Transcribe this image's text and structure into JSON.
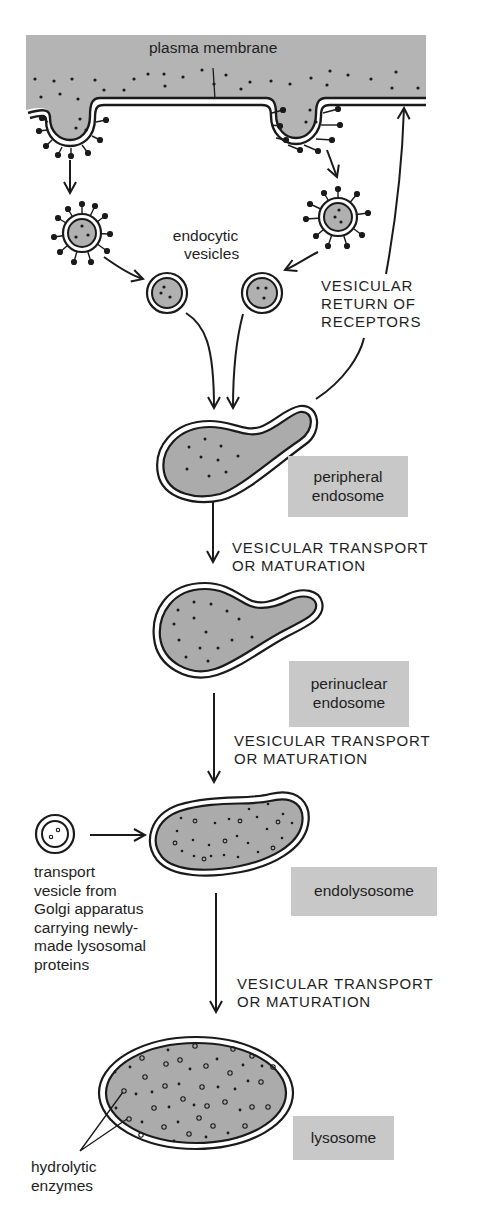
{
  "diagram": {
    "type": "endocytic pathway",
    "colors": {
      "cytoplasm_fill": "#b4b4b4",
      "organelle_fill": "#ababab",
      "label_box_fill": "#c8c8c8",
      "line": "#1a1a1a",
      "background": "#ffffff"
    },
    "labels": {
      "plasma_membrane": "plasma membrane",
      "endocytic_vesicles": [
        "endocytic",
        "vesicles"
      ],
      "vesicular_return": [
        "VESICULAR",
        "RETURN OF",
        "RECEPTORS"
      ],
      "transport_1": [
        "VESICULAR TRANSPORT",
        "OR MATURATION"
      ],
      "transport_2": [
        "VESICULAR TRANSPORT",
        "OR MATURATION"
      ],
      "transport_3": [
        "VESICULAR TRANSPORT",
        "OR MATURATION"
      ],
      "golgi_vesicle": [
        "transport",
        "vesicle from",
        "Golgi apparatus",
        "carrying newly-",
        "made lysosomal",
        "proteins"
      ],
      "hydrolytic_enzymes": [
        "hydrolytic",
        "enzymes"
      ]
    },
    "stages": [
      {
        "name": "peripheral endosome",
        "lines": [
          "peripheral",
          "endosome"
        ]
      },
      {
        "name": "perinuclear endosome",
        "lines": [
          "perinuclear",
          "endosome"
        ]
      },
      {
        "name": "endolysosome",
        "lines": [
          "endolysosome"
        ]
      },
      {
        "name": "lysosome",
        "lines": [
          "lysosome"
        ]
      }
    ]
  }
}
